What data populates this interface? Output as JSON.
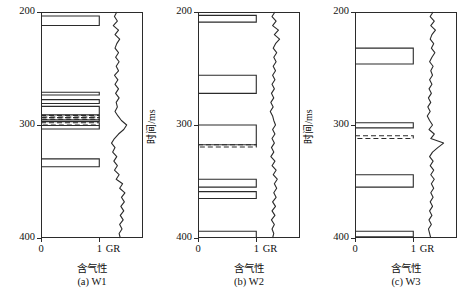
{
  "figure": {
    "axis": {
      "y_title": "时间/ms",
      "x_title": "含气性",
      "gr_label": "GR",
      "y_ticks": [
        200,
        300,
        400
      ],
      "y_tick_labels": [
        "200",
        "300",
        "400"
      ],
      "x_ticks": [
        0,
        1
      ],
      "x_tick_labels": [
        "0",
        "1"
      ],
      "ylim": [
        200,
        400
      ],
      "xlim": [
        0,
        1.75
      ],
      "y_inverted": true
    },
    "line_color": "#2b2b2b",
    "panels": [
      {
        "id": "w1",
        "caption": "(a)  W1",
        "well": "W1",
        "chart_data": {
          "type": "bar",
          "title": "(a)  W1",
          "xlabel": "含气性",
          "ylabel": "时间/ms",
          "ylim": [
            200,
            400
          ],
          "xlim": [
            0,
            1.75
          ],
          "grid": false,
          "gas_intervals": [
            {
              "top": 203.5,
              "bottom": 212.0,
              "value": 1.0,
              "style": "solid"
            },
            {
              "top": 271.0,
              "bottom": 273.5,
              "value": 1.0,
              "style": "solid"
            },
            {
              "top": 277.5,
              "bottom": 281.0,
              "value": 1.0,
              "style": "solid"
            },
            {
              "top": 283.5,
              "bottom": 291.0,
              "value": 1.0,
              "style": "solid"
            },
            {
              "top": 291.5,
              "bottom": 293.0,
              "value": 1.0,
              "style": "dashed"
            },
            {
              "top": 293.5,
              "bottom": 295.0,
              "value": 1.0,
              "style": "dashed"
            },
            {
              "top": 295.5,
              "bottom": 297.0,
              "value": 1.0,
              "style": "solid"
            },
            {
              "top": 298.0,
              "bottom": 300.0,
              "value": 1.0,
              "style": "dashed"
            },
            {
              "top": 300.5,
              "bottom": 303.5,
              "value": 1.0,
              "style": "solid"
            },
            {
              "top": 330.0,
              "bottom": 337.0,
              "value": 1.0,
              "style": "solid"
            }
          ],
          "gr_curve": {
            "name": "GR",
            "t": [
              200,
              204,
              208,
              212,
              216,
              220,
              224,
              228,
              232,
              236,
              240,
              244,
              248,
              252,
              256,
              260,
              264,
              268,
              272,
              276,
              280,
              284,
              288,
              292,
              296,
              300,
              304,
              308,
              312,
              316,
              320,
              324,
              328,
              332,
              336,
              340,
              344,
              348,
              352,
              356,
              360,
              364,
              368,
              372,
              376,
              380,
              384,
              388,
              392,
              396,
              400
            ],
            "v": [
              1.3,
              1.26,
              1.31,
              1.24,
              1.33,
              1.27,
              1.35,
              1.3,
              1.27,
              1.33,
              1.28,
              1.34,
              1.29,
              1.33,
              1.26,
              1.32,
              1.27,
              1.33,
              1.28,
              1.34,
              1.29,
              1.31,
              1.27,
              1.32,
              1.38,
              1.47,
              1.42,
              1.33,
              1.26,
              1.21,
              1.27,
              1.23,
              1.3,
              1.25,
              1.31,
              1.26,
              1.34,
              1.29,
              1.4,
              1.35,
              1.44,
              1.38,
              1.43,
              1.37,
              1.42,
              1.36,
              1.41,
              1.35,
              1.39,
              1.34,
              1.36
            ]
          }
        }
      },
      {
        "id": "w2",
        "caption": "(b)  W2",
        "well": "W2",
        "chart_data": {
          "type": "bar",
          "title": "(b)  W2",
          "xlabel": "含气性",
          "ylabel": "时间/ms",
          "ylim": [
            200,
            400
          ],
          "xlim": [
            0,
            1.75
          ],
          "grid": false,
          "gas_intervals": [
            {
              "top": 203.0,
              "bottom": 209.0,
              "value": 1.0,
              "style": "solid"
            },
            {
              "top": 256.0,
              "bottom": 272.0,
              "value": 1.0,
              "style": "solid"
            },
            {
              "top": 300.0,
              "bottom": 317.5,
              "value": 1.0,
              "style": "solid"
            },
            {
              "top": 317.5,
              "bottom": 319.5,
              "value": 1.0,
              "style": "dashed"
            },
            {
              "top": 348.0,
              "bottom": 355.0,
              "value": 1.0,
              "style": "solid"
            },
            {
              "top": 359.0,
              "bottom": 365.0,
              "value": 1.0,
              "style": "solid"
            },
            {
              "top": 394.0,
              "bottom": 399.5,
              "value": 1.0,
              "style": "solid"
            }
          ],
          "gr_curve": {
            "name": "GR",
            "t": [
              200,
              204,
              208,
              212,
              216,
              220,
              224,
              228,
              232,
              236,
              240,
              244,
              248,
              252,
              256,
              260,
              264,
              268,
              272,
              276,
              280,
              284,
              288,
              292,
              296,
              300,
              304,
              308,
              312,
              316,
              320,
              324,
              328,
              332,
              336,
              340,
              344,
              348,
              352,
              356,
              360,
              364,
              368,
              372,
              376,
              380,
              384,
              388,
              392,
              396,
              400
            ],
            "v": [
              1.32,
              1.27,
              1.34,
              1.28,
              1.38,
              1.31,
              1.4,
              1.33,
              1.29,
              1.35,
              1.3,
              1.34,
              1.29,
              1.33,
              1.28,
              1.32,
              1.27,
              1.31,
              1.26,
              1.3,
              1.25,
              1.29,
              1.24,
              1.28,
              1.3,
              1.33,
              1.28,
              1.32,
              1.27,
              1.31,
              1.26,
              1.3,
              1.25,
              1.32,
              1.27,
              1.34,
              1.29,
              1.36,
              1.31,
              1.35,
              1.3,
              1.34,
              1.28,
              1.33,
              1.27,
              1.32,
              1.26,
              1.31,
              1.27,
              1.3,
              1.28
            ]
          }
        }
      },
      {
        "id": "w3",
        "caption": "(c)  W3",
        "well": "W3",
        "chart_data": {
          "type": "bar",
          "title": "(c)  W3",
          "xlabel": "含气性",
          "ylabel": "时间/ms",
          "ylim": [
            200,
            400
          ],
          "xlim": [
            0,
            1.75
          ],
          "grid": false,
          "gas_intervals": [
            {
              "top": 232.0,
              "bottom": 246.0,
              "value": 1.0,
              "style": "solid"
            },
            {
              "top": 298.0,
              "bottom": 302.5,
              "value": 1.0,
              "style": "solid"
            },
            {
              "top": 309.5,
              "bottom": 312.0,
              "value": 1.0,
              "style": "dashed"
            },
            {
              "top": 344.0,
              "bottom": 355.0,
              "value": 1.0,
              "style": "solid"
            },
            {
              "top": 394.0,
              "bottom": 399.0,
              "value": 1.0,
              "style": "solid"
            }
          ],
          "gr_curve": {
            "name": "GR",
            "t": [
              200,
              204,
              208,
              212,
              216,
              220,
              224,
              228,
              232,
              236,
              240,
              244,
              248,
              252,
              256,
              260,
              264,
              268,
              272,
              276,
              280,
              284,
              288,
              292,
              296,
              300,
              304,
              308,
              312,
              316,
              320,
              324,
              328,
              332,
              336,
              340,
              344,
              348,
              352,
              356,
              360,
              364,
              368,
              372,
              376,
              380,
              384,
              388,
              392,
              396,
              400
            ],
            "v": [
              1.34,
              1.29,
              1.36,
              1.3,
              1.38,
              1.32,
              1.29,
              1.35,
              1.31,
              1.37,
              1.32,
              1.28,
              1.34,
              1.3,
              1.33,
              1.28,
              1.32,
              1.27,
              1.31,
              1.26,
              1.3,
              1.25,
              1.29,
              1.24,
              1.28,
              1.33,
              1.27,
              1.36,
              1.3,
              1.52,
              1.42,
              1.33,
              1.28,
              1.34,
              1.29,
              1.35,
              1.3,
              1.36,
              1.31,
              1.35,
              1.3,
              1.34,
              1.29,
              1.33,
              1.28,
              1.32,
              1.27,
              1.31,
              1.26,
              1.28,
              1.3
            ]
          }
        }
      }
    ]
  }
}
